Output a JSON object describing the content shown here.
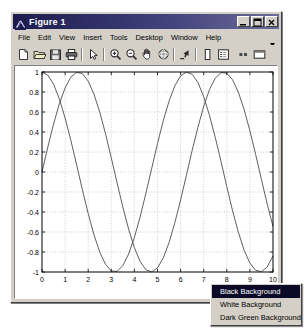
{
  "window": {
    "title": "Figure 1",
    "title_icon": "matlab-membrane-icon",
    "minimize_label": "_",
    "maximize_label": "□",
    "close_label": "✕"
  },
  "menu": {
    "items": [
      {
        "label": "File"
      },
      {
        "label": "Edit"
      },
      {
        "label": "View"
      },
      {
        "label": "Insert"
      },
      {
        "label": "Tools"
      },
      {
        "label": "Desktop"
      },
      {
        "label": "Window"
      },
      {
        "label": "Help"
      }
    ],
    "overflow_icon": "chevron-down-icon"
  },
  "toolbar": {
    "buttons": [
      {
        "name": "new-figure-icon",
        "tooltip": "New Figure"
      },
      {
        "name": "open-file-icon",
        "tooltip": "Open File"
      },
      {
        "name": "save-figure-icon",
        "tooltip": "Save Figure"
      },
      {
        "name": "print-figure-icon",
        "tooltip": "Print Figure"
      },
      {
        "name": "edit-plot-icon",
        "tooltip": "Edit Plot"
      },
      {
        "name": "zoom-in-icon",
        "tooltip": "Zoom In"
      },
      {
        "name": "zoom-out-icon",
        "tooltip": "Zoom Out"
      },
      {
        "name": "pan-icon",
        "tooltip": "Pan"
      },
      {
        "name": "rotate-3d-icon",
        "tooltip": "Rotate 3D"
      },
      {
        "name": "data-cursor-icon",
        "tooltip": "Data Cursor"
      },
      {
        "name": "insert-colorbar-icon",
        "tooltip": "Insert Colorbar"
      },
      {
        "name": "insert-legend-icon",
        "tooltip": "Insert Legend"
      },
      {
        "name": "hide-plot-tools-icon",
        "tooltip": "Hide Plot Tools"
      },
      {
        "name": "show-plot-tools-icon",
        "tooltip": "Show Plot Tools"
      }
    ]
  },
  "context_menu": {
    "items": [
      {
        "label": "Black Background",
        "selected": true
      },
      {
        "label": "White Background",
        "selected": false
      },
      {
        "label": "Dark Green Background",
        "selected": false
      }
    ]
  },
  "colors": {
    "title_bar_start": "#1b1b4d",
    "title_bar_end": "#6a6a99",
    "window_face": "#d4d0c8",
    "plot_background": "#ffffff",
    "axes_line": "#000000",
    "grid_line": "#b0b0b0",
    "curve_color": "#4d4d4d",
    "menu_highlight": "#0a0a28"
  },
  "chart_data": {
    "type": "line",
    "title": "",
    "xlabel": "",
    "ylabel": "",
    "xlim": [
      0,
      10
    ],
    "ylim": [
      -1,
      1
    ],
    "grid": true,
    "legend": null,
    "xticks": [
      0,
      1,
      2,
      3,
      4,
      5,
      6,
      7,
      8,
      9,
      10
    ],
    "xticklabels": [
      "0",
      "1",
      "2",
      "3",
      "4",
      "5",
      "6",
      "7",
      "8",
      "9",
      "10"
    ],
    "yticks": [
      -1,
      -0.8,
      -0.6,
      -0.4,
      -0.2,
      0,
      0.2,
      0.4,
      0.6,
      0.8,
      1
    ],
    "yticklabels": [
      "-1",
      "-0.8",
      "-0.6",
      "-0.4",
      "-0.2",
      "0",
      "0.2",
      "0.4",
      "0.6",
      "0.8",
      "1"
    ],
    "series": [
      {
        "name": "cos(x)",
        "color": "#4d4d4d",
        "x": [
          0,
          0.25,
          0.5,
          0.75,
          1,
          1.25,
          1.5,
          1.75,
          2,
          2.25,
          2.5,
          2.75,
          3,
          3.25,
          3.5,
          3.75,
          4,
          4.25,
          4.5,
          4.75,
          5,
          5.25,
          5.5,
          5.75,
          6,
          6.25,
          6.5,
          6.75,
          7,
          7.25,
          7.5,
          7.75,
          8,
          8.25,
          8.5,
          8.75,
          9,
          9.25,
          9.5,
          9.75,
          10
        ],
        "y": [
          1,
          0.969,
          0.878,
          0.732,
          0.54,
          0.315,
          0.071,
          -0.178,
          -0.416,
          -0.628,
          -0.801,
          -0.924,
          -0.99,
          -0.994,
          -0.936,
          -0.82,
          -0.654,
          -0.447,
          -0.211,
          0.037,
          0.284,
          0.513,
          0.709,
          0.862,
          0.96,
          0.999,
          0.977,
          0.895,
          0.754,
          0.566,
          0.347,
          0.105,
          -0.146,
          -0.388,
          -0.602,
          -0.782,
          -0.911,
          -0.983,
          -0.997,
          -0.95,
          -0.839
        ]
      },
      {
        "name": "sin(x)",
        "color": "#4d4d4d",
        "x": [
          0,
          0.25,
          0.5,
          0.75,
          1,
          1.25,
          1.5,
          1.75,
          2,
          2.25,
          2.5,
          2.75,
          3,
          3.25,
          3.5,
          3.75,
          4,
          4.25,
          4.5,
          4.75,
          5,
          5.25,
          5.5,
          5.75,
          6,
          6.25,
          6.5,
          6.75,
          7,
          7.25,
          7.5,
          7.75,
          8,
          8.25,
          8.5,
          8.75,
          9,
          9.25,
          9.5,
          9.75,
          10
        ],
        "y": [
          0,
          0.247,
          0.479,
          0.682,
          0.841,
          0.949,
          0.997,
          0.984,
          0.909,
          0.778,
          0.599,
          0.382,
          0.141,
          -0.108,
          -0.351,
          -0.572,
          -0.757,
          -0.895,
          -0.978,
          -0.999,
          -0.959,
          -0.859,
          -0.706,
          -0.508,
          -0.279,
          -0.034,
          0.215,
          0.447,
          0.657,
          0.824,
          0.938,
          0.994,
          0.989,
          0.922,
          0.798,
          0.624,
          0.412,
          0.174,
          -0.075,
          -0.32,
          -0.544
        ]
      }
    ]
  }
}
